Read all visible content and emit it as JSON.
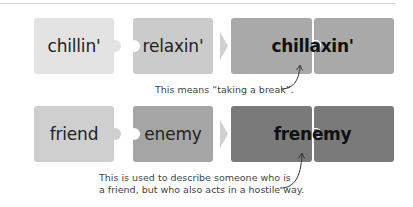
{
  "colors": {
    "row1_piece1": "#e3e3e3",
    "row1_piece2": "#cbcbcb",
    "row1_result": "#a9a9a9",
    "row2_piece1": "#cfcfcf",
    "row2_piece2": "#a5a5a5",
    "row2_result": "#7a7a7a",
    "arrow": "#d2d2d2",
    "caption_text": "#444444"
  },
  "rows": [
    {
      "word1": "chillin'",
      "word2": "relaxin'",
      "result": "chillaxin'",
      "caption_lines": [
        "This means “taking a break”."
      ]
    },
    {
      "word1": "friend",
      "word2": "enemy",
      "result": "frenemy",
      "caption_lines": [
        "This is used to describe someone who is",
        "a friend, but who also acts in a hostile way."
      ]
    }
  ],
  "icons": {
    "combine_arrow": "right-chevron-arrow",
    "pointer_arrow": "curved-pointer-arrow"
  }
}
